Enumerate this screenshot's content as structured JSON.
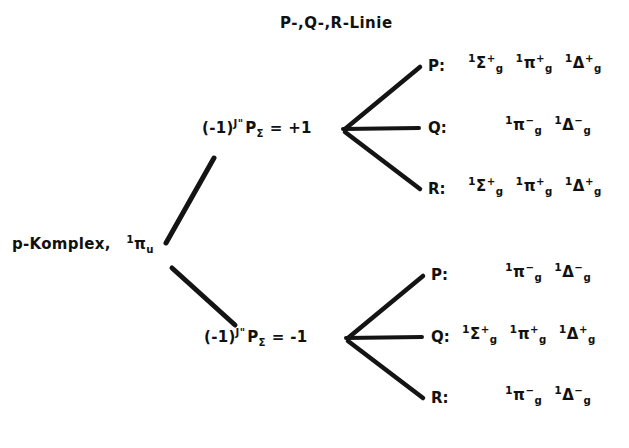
{
  "diagram": {
    "title": "P-,Q-,R-Linie",
    "root": {
      "label_text": "p-Komplex,",
      "root_term": "¹πᵤ",
      "root_presup": "1",
      "root_symbol": "π",
      "root_sub": "u"
    },
    "nodes": [
      {
        "id": "node-plus",
        "prefix": "(-1)",
        "exponent": "J\"",
        "operator": "P",
        "operator_sub": "Σ",
        "equals": "= +1",
        "full_label": "(-1)J\" PΣ = +1",
        "branches": [
          {
            "id": "branch-p-upper",
            "letter": "P:",
            "terms": [
              {
                "presup": "1",
                "symbol": "Σ",
                "sub": "g",
                "sup": "+"
              },
              {
                "presup": "1",
                "symbol": "π",
                "sub": "g",
                "sup": "+"
              },
              {
                "presup": "1",
                "symbol": "Δ",
                "sub": "g",
                "sup": "+"
              }
            ]
          },
          {
            "id": "branch-q-upper",
            "letter": "Q:",
            "terms": [
              {
                "presup": "1",
                "symbol": "π",
                "sub": "g",
                "sup": "−"
              },
              {
                "presup": "1",
                "symbol": "Δ",
                "sub": "g",
                "sup": "−"
              }
            ]
          },
          {
            "id": "branch-r-upper",
            "letter": "R:",
            "terms": [
              {
                "presup": "1",
                "symbol": "Σ",
                "sub": "g",
                "sup": "+"
              },
              {
                "presup": "1",
                "symbol": "π",
                "sub": "g",
                "sup": "+"
              },
              {
                "presup": "1",
                "symbol": "Δ",
                "sub": "g",
                "sup": "+"
              }
            ]
          }
        ]
      },
      {
        "id": "node-minus",
        "prefix": "(-1)",
        "exponent": "J\"",
        "operator": "P",
        "operator_sub": "Σ",
        "equals": "= -1",
        "full_label": "(-1)J\" PΣ = -1",
        "branches": [
          {
            "id": "branch-p-lower",
            "letter": "P:",
            "terms": [
              {
                "presup": "1",
                "symbol": "π",
                "sub": "g",
                "sup": "−"
              },
              {
                "presup": "1",
                "symbol": "Δ",
                "sub": "g",
                "sup": "−"
              }
            ]
          },
          {
            "id": "branch-q-lower",
            "letter": "Q:",
            "terms": [
              {
                "presup": "1",
                "symbol": "Σ",
                "sub": "g",
                "sup": "+"
              },
              {
                "presup": "1",
                "symbol": "π",
                "sub": "g",
                "sup": "+"
              },
              {
                "presup": "1",
                "symbol": "Δ",
                "sub": "g",
                "sup": "+"
              }
            ]
          },
          {
            "id": "branch-r-lower",
            "letter": "R:",
            "terms": [
              {
                "presup": "1",
                "symbol": "π",
                "sub": "g",
                "sup": "−"
              },
              {
                "presup": "1",
                "symbol": "Δ",
                "sub": "g",
                "sup": "−"
              }
            ]
          }
        ]
      }
    ],
    "colors": {
      "ink": "#141414",
      "background": "#ffffff"
    }
  }
}
